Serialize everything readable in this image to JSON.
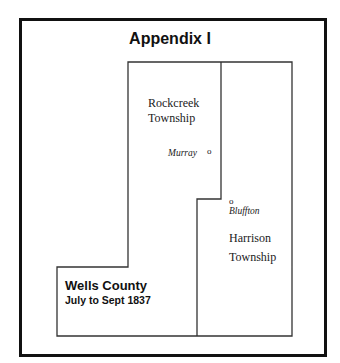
{
  "title": "Appendix I",
  "townships": [
    {
      "name_line1": "Rockcreek",
      "name_line2": "Township"
    },
    {
      "name_line1": "Harrison",
      "name_line2": "Township"
    }
  ],
  "towns": [
    {
      "name": "Murray",
      "marker": "o"
    },
    {
      "name": "Bluffton",
      "marker": "o"
    }
  ],
  "legend": {
    "county": "Wells County",
    "period": "July to Sept 1837"
  }
}
